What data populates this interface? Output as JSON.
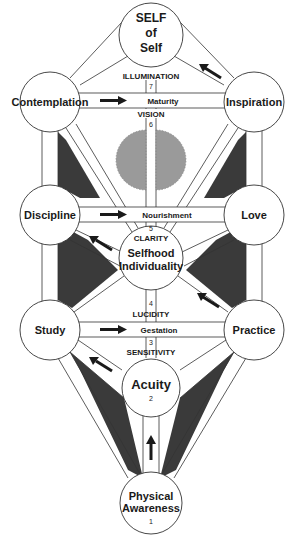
{
  "diagram": {
    "colors": {
      "background": "#ffffff",
      "stroke": "#333333",
      "dark_fill": "#3a3a3a",
      "gray_circle": "#9a9a9a",
      "node_fill": "#ffffff"
    },
    "nodes": {
      "self_of_self": {
        "line1": "SELF",
        "line2": "of",
        "line3": "Self"
      },
      "contemplation": {
        "label": "Contemplation"
      },
      "inspiration": {
        "label": "Inspiration"
      },
      "discipline": {
        "label": "Discipline"
      },
      "love": {
        "label": "Love"
      },
      "selfhood": {
        "line1": "Selfhood",
        "line2": "Individuality"
      },
      "study": {
        "label": "Study"
      },
      "practice": {
        "label": "Practice"
      },
      "acuity": {
        "label": "Acuity",
        "number": "2"
      },
      "physical_awareness": {
        "line1": "Physical",
        "line2": "Awareness",
        "number": "1"
      }
    },
    "horizontal_paths": {
      "maturity": {
        "label": "Maturity"
      },
      "nourishment": {
        "label": "Nourishment"
      },
      "gestation": {
        "label": "Gestation"
      }
    },
    "vertical_levels": {
      "illumination": {
        "label": "ILLUMINATION",
        "number": "7"
      },
      "vision": {
        "label": "VISION",
        "number": "6"
      },
      "clarity": {
        "label": "CLARITY",
        "number": "5"
      },
      "lucidity": {
        "label": "LUCIDITY",
        "number": "4"
      },
      "sensitivity": {
        "label": "SENSITIVITY",
        "number": "3"
      }
    }
  }
}
